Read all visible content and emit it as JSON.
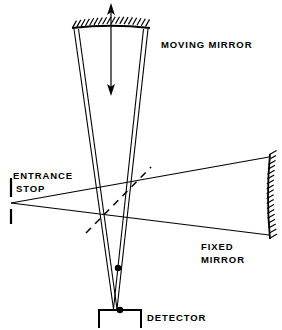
{
  "figure": {
    "background_color": "#ffffff",
    "ink_color": "#000000",
    "width": 282,
    "height": 330
  },
  "labels": {
    "moving_mirror": "MOVING MIRROR",
    "entrance_stop_line1": "ENTRANCE",
    "entrance_stop_line2": "STOP",
    "fixed_mirror_line1": "FIXED",
    "fixed_mirror_line2": "MIRROR",
    "detector": "DETECTOR"
  },
  "components": {
    "moving_mirror": {
      "name": "moving-mirror",
      "kind": "curved-mirror",
      "orientation": "horizontal",
      "hatching": "above",
      "hatch_count": 18,
      "span_x": [
        74,
        148
      ],
      "y": 26,
      "curve_sag": 3
    },
    "fixed_mirror": {
      "name": "fixed-mirror",
      "kind": "curved-mirror",
      "orientation": "vertical",
      "hatching": "right",
      "hatch_count": 17,
      "span_y": [
        155,
        238
      ],
      "x": 269,
      "curve_sag": 3
    },
    "entrance_stop": {
      "name": "entrance-stop",
      "kind": "slit-stop",
      "upper_bar": [
        11,
        178,
        11,
        197
      ],
      "lower_bar": [
        11,
        209,
        11,
        224
      ],
      "aperture_center": [
        11,
        203
      ]
    },
    "beamsplitter": {
      "name": "beamsplitter",
      "kind": "dashed-plate",
      "endpoints": [
        88,
        231,
        149,
        169
      ],
      "dash_pattern": "7 6"
    },
    "detector": {
      "name": "detector",
      "kind": "bracket-box",
      "box": [
        99,
        310,
        141,
        328
      ],
      "open_side": "bottom",
      "focus_dot": [
        120,
        310
      ]
    },
    "intermediate_focus": {
      "name": "intermediate-focus",
      "point": [
        118,
        268
      ]
    },
    "motion_arrow": {
      "name": "mirror-motion-arrow",
      "kind": "double-headed-arrow",
      "x": 111,
      "y_top": 7,
      "y_bottom": 92,
      "heads": "both"
    }
  },
  "rays": {
    "vertical_bundle_left": [
      [
        74,
        29,
        113,
        309
      ],
      [
        78,
        29,
        117,
        309
      ]
    ],
    "vertical_bundle_right": [
      [
        148,
        29,
        117,
        309
      ],
      [
        144,
        29,
        113,
        309
      ]
    ],
    "horizontal_upper": [
      11,
      203,
      269,
      157
    ],
    "horizontal_lower": [
      11,
      203,
      269,
      235
    ]
  },
  "text_positions": {
    "moving_mirror": [
      161,
      48
    ],
    "entrance_stop": [
      14,
      180
    ],
    "fixed_mirror": [
      200,
      251
    ],
    "detector": [
      146,
      318
    ]
  }
}
